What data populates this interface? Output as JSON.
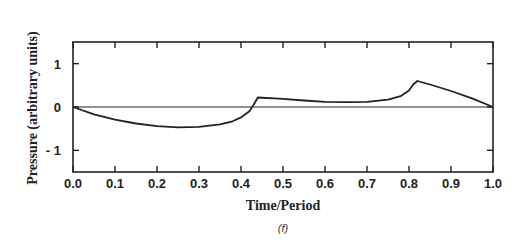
{
  "chart_data": {
    "type": "line",
    "title": "",
    "caption": "(f)",
    "xlabel": "Time/Period",
    "ylabel": "Pressure (arbitrary units)",
    "xlim": [
      0.0,
      1.0
    ],
    "ylim": [
      -1.5,
      1.5
    ],
    "xticks": [
      "0.0",
      "0.1",
      "0.2",
      "0.3",
      "0.4",
      "0.5",
      "0.6",
      "0.7",
      "0.8",
      "0.9",
      "1.0"
    ],
    "yticks": [
      "1",
      "0",
      "- 1"
    ],
    "grid": false,
    "legend": null,
    "series": [
      {
        "name": "pressure",
        "x": [
          0.0,
          0.05,
          0.1,
          0.15,
          0.2,
          0.25,
          0.3,
          0.35,
          0.38,
          0.4,
          0.42,
          0.43,
          0.44,
          0.5,
          0.55,
          0.6,
          0.65,
          0.7,
          0.75,
          0.78,
          0.8,
          0.81,
          0.82,
          0.85,
          0.9,
          0.95,
          1.0
        ],
        "y": [
          0.0,
          -0.17,
          -0.29,
          -0.38,
          -0.44,
          -0.47,
          -0.46,
          -0.4,
          -0.33,
          -0.24,
          -0.1,
          0.05,
          0.22,
          0.19,
          0.15,
          0.12,
          0.11,
          0.12,
          0.17,
          0.25,
          0.38,
          0.52,
          0.6,
          0.52,
          0.37,
          0.2,
          0.0
        ]
      },
      {
        "name": "zero-baseline",
        "x": [
          0.0,
          1.0
        ],
        "y": [
          0.0,
          0.0
        ]
      }
    ]
  }
}
